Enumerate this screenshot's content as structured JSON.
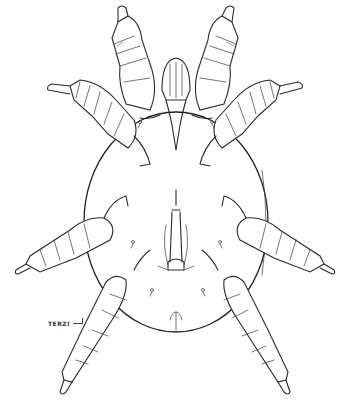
{
  "illustration": {
    "subject": "mite (dorsal/ventral line drawing)",
    "style": "black ink line art on white",
    "colors": {
      "background": "#ffffff",
      "ink": "#2a2a2a",
      "accent": "#d9435a"
    },
    "signature": "TERZI"
  }
}
